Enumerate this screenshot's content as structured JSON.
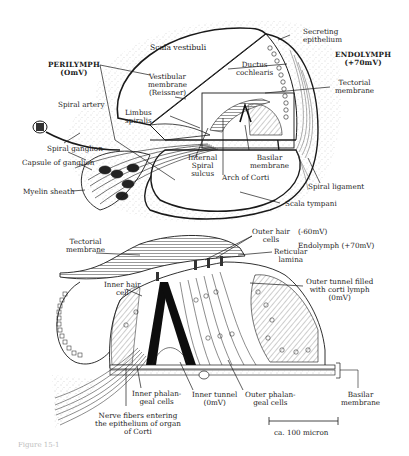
{
  "figure": {
    "caption": "Figure 15-1",
    "upper_panel": {
      "title": "Cross-section of cochlear duct",
      "labels": {
        "scala_vestibuli": "Scala vestibuli",
        "secreting_epithelium": [
          "Secreting",
          "epithelium"
        ],
        "endolymph": [
          "ENDOLYMPH",
          "(+70mV)"
        ],
        "perilymph": [
          "PERILYMPH",
          "(OmV)"
        ],
        "vestibular_membrane": [
          "Vestibular",
          "membrane",
          "(Reissner)"
        ],
        "ductus_cochlearis": [
          "Ductus",
          "cochlearis"
        ],
        "tectorial_membrane": [
          "Tectorial",
          "membrane"
        ],
        "spiral_artery": "Spiral artery",
        "limbus_spiralis": [
          "Limbus",
          "spiralis"
        ],
        "spiral_ganglion": "Spiral ganglion",
        "capsule_of_ganglion": "Capsule of ganglion",
        "internal_spiral_sulcus": [
          "Internal",
          "Spiral",
          "sulcus"
        ],
        "basilar_membrane": [
          "Basilar",
          "membrane"
        ],
        "arch_of_corti": "Arch of Corti",
        "myelin_sheath": "Myelin sheath",
        "spiral_ligament": "Spiral ligament",
        "scala_tympani": "Scala tympani"
      }
    },
    "lower_panel": {
      "title": "Organ of Corti (enlarged)",
      "labels": {
        "tectorial_membrane": [
          "Tectorial",
          "membrane"
        ],
        "outer_hair_cells": [
          "Outer hair",
          "cells"
        ],
        "outer_hair_cells_potential": "(-60mV)",
        "endolymph": "Endolymph (+70mV)",
        "reticular_lamina": [
          "Reticular",
          "lamina"
        ],
        "inner_hair_cell": [
          "Inner hair",
          "cell"
        ],
        "outer_tunnel": [
          "Outer tunnel filled",
          "with corti lymph",
          "(0mV)"
        ],
        "inner_phalangeal_cells": [
          "Inner phalan-",
          "geal cells"
        ],
        "inner_tunnel": [
          "Inner tunnel",
          "(0mV)"
        ],
        "outer_phalangeal_cells": [
          "Outer phalan-",
          "geal cells"
        ],
        "basilar_membrane": [
          "Basilar",
          "membrane"
        ],
        "nerve_fibers": [
          "Nerve fibers entering",
          "the epithelium of organ",
          "of Corti"
        ],
        "scale_bar": "ca. 100 micron"
      }
    },
    "colors": {
      "ink": "#1a1a1a",
      "background": "#ffffff",
      "stipple": "#9a9a9a",
      "caption": "#bdbdbd"
    }
  }
}
